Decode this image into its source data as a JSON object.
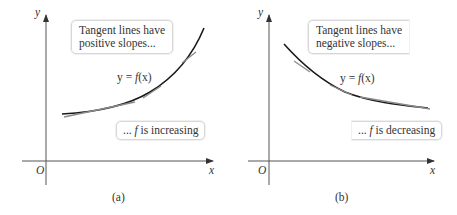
{
  "panels": [
    {
      "id": "a",
      "caption": "(a)",
      "axis_labels": {
        "x": "x",
        "y": "y",
        "origin": "O"
      },
      "callout_top": {
        "line1": "Tangent lines have",
        "line2": "positive slopes..."
      },
      "function_label": {
        "lhs": "y = ",
        "fn": "f",
        "arg": "(x)"
      },
      "callout_bottom": {
        "prefix": "... ",
        "fn": "f",
        "text": " is increasing"
      }
    },
    {
      "id": "b",
      "caption": "(b)",
      "axis_labels": {
        "x": "x",
        "y": "y",
        "origin": "O"
      },
      "callout_top": {
        "line1": "Tangent lines have",
        "line2": "negative slopes..."
      },
      "function_label": {
        "lhs": "y = ",
        "fn": "f",
        "arg": "(x)"
      },
      "callout_bottom": {
        "prefix": "... ",
        "fn": "f",
        "text": " is decreasing"
      }
    }
  ],
  "colors": {
    "curve": "#1a1a1a",
    "tangent": "#8a8a8a",
    "axis": "#555555",
    "box_border": "#d8d8d8"
  }
}
